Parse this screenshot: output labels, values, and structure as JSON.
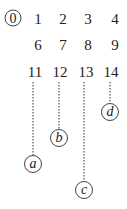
{
  "root": {
    "label": "0",
    "x": 13,
    "y": 18
  },
  "rows": [
    {
      "y": 19,
      "items": [
        {
          "label": "1",
          "x": 38
        },
        {
          "label": "2",
          "x": 63
        },
        {
          "label": "3",
          "x": 88
        },
        {
          "label": "4",
          "x": 115
        }
      ]
    },
    {
      "y": 45,
      "items": [
        {
          "label": "6",
          "x": 38
        },
        {
          "label": "7",
          "x": 63
        },
        {
          "label": "8",
          "x": 88
        },
        {
          "label": "9",
          "x": 115
        }
      ]
    },
    {
      "y": 72,
      "items": [
        {
          "label": "11",
          "x": 35
        },
        {
          "label": "12",
          "x": 60
        },
        {
          "label": "13",
          "x": 86
        },
        {
          "label": "14",
          "x": 111
        }
      ]
    }
  ],
  "leaves": [
    {
      "label": "a",
      "x": 33,
      "y": 164,
      "from_y": 82
    },
    {
      "label": "b",
      "x": 59,
      "y": 138,
      "from_y": 82
    },
    {
      "label": "c",
      "x": 84,
      "y": 190,
      "from_y": 82
    },
    {
      "label": "d",
      "x": 110,
      "y": 112,
      "from_y": 82
    }
  ]
}
